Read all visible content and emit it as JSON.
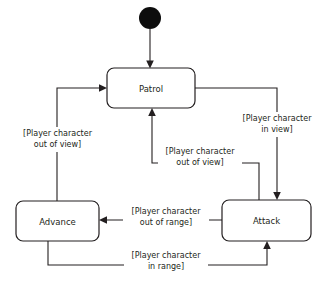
{
  "diagram": {
    "type": "uml-state-machine",
    "title": "",
    "initial_node": {
      "name": "initial-pseudostate",
      "cx": 150,
      "cy": 18,
      "r": 11
    },
    "states": [
      {
        "id": "patrol",
        "label": "Patrol",
        "x": 107,
        "y": 68,
        "w": 88,
        "h": 40
      },
      {
        "id": "advance",
        "label": "Advance",
        "x": 16,
        "y": 201,
        "w": 83,
        "h": 40
      },
      {
        "id": "attack",
        "label": "Attack",
        "x": 222,
        "y": 200,
        "w": 89,
        "h": 41
      }
    ],
    "transitions": [
      {
        "id": "start-to-patrol",
        "from": "initial-pseudostate",
        "to": "patrol",
        "guard_line1": "",
        "guard_line2": ""
      },
      {
        "id": "patrol-to-attack",
        "from": "patrol",
        "to": "attack",
        "guard_line1": "[Player character",
        "guard_line2": "in view]"
      },
      {
        "id": "attack-to-patrol",
        "from": "attack",
        "to": "patrol",
        "guard_line1": "[Player character",
        "guard_line2": "out of view]"
      },
      {
        "id": "advance-to-patrol",
        "from": "advance",
        "to": "patrol",
        "guard_line1": "[Player character",
        "guard_line2": "out of view]"
      },
      {
        "id": "attack-to-advance",
        "from": "attack",
        "to": "advance",
        "guard_line1": "[Player character",
        "guard_line2": "out of range]"
      },
      {
        "id": "advance-to-attack",
        "from": "advance",
        "to": "attack",
        "guard_line1": "[Player character",
        "guard_line2": "in range]"
      }
    ],
    "colors": {
      "stroke": "#231f20",
      "fill": "#ffffff",
      "initial_fill": "#0d0d0d",
      "caption": "#9a9a9a"
    },
    "caption": ""
  }
}
